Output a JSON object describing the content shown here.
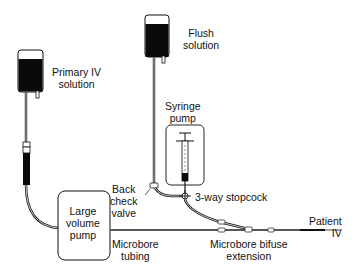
{
  "diagram": {
    "type": "IV infusion setup",
    "labels": {
      "primary_iv": [
        "Primary IV",
        "solution"
      ],
      "flush": [
        "Flush",
        "solution"
      ],
      "syringe_pump": [
        "Syringe",
        "pump"
      ],
      "large_volume_pump": [
        "Large",
        "volume",
        "pump"
      ],
      "back_check_valve": [
        "Back",
        "check",
        "valve"
      ],
      "stopcock": [
        "3-way stopcock"
      ],
      "patient_iv": [
        "Patient",
        "IV"
      ],
      "microbore_tubing": [
        "Microbore",
        "tubing"
      ],
      "bifuse_extension": [
        "Microbore bifuse",
        "extension"
      ]
    },
    "colors": {
      "ink": "#111111",
      "fill": "#0a0a0a",
      "background": "#ffffff"
    }
  }
}
